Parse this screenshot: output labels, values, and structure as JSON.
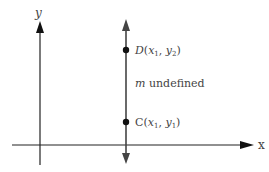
{
  "axes": {
    "x_label": "x",
    "y_label": "y"
  },
  "points": {
    "D": {
      "name": "D",
      "open": "(",
      "x": "x",
      "xsub": "1",
      "sep": ", ",
      "y": "y",
      "ysub": "2",
      "close": ")"
    },
    "C": {
      "name": "C",
      "open": "(",
      "x": "x",
      "xsub": "1",
      "sep": ", ",
      "y": "y",
      "ysub": "1",
      "close": ")"
    }
  },
  "annotation": {
    "m": "m",
    "text": " undefined"
  },
  "colors": {
    "axis": "#222222",
    "vertical_line": "#444444",
    "label": "#444444"
  }
}
